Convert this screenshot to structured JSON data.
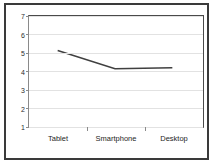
{
  "chart_data": {
    "type": "line",
    "title": "",
    "subtitle": "",
    "xlabel": "",
    "ylabel": "",
    "categories": [
      "Tablet",
      "Smartphone",
      "Desktop"
    ],
    "series": [
      {
        "name": "",
        "values": [
          5.1,
          4.1,
          4.15
        ],
        "color": "#404040"
      }
    ],
    "ylim": [
      1,
      7
    ],
    "yticks": [
      1,
      2,
      3,
      4,
      5,
      6,
      7
    ],
    "ytick_labels": [
      "1",
      "2",
      "3",
      "4",
      "5",
      "6",
      "7"
    ],
    "grid": true,
    "grid_axis": "y",
    "legend": false,
    "legend_position": "none",
    "markers": false,
    "colors": {
      "frame": "#3a3a3a",
      "plot_border": "#4a4a4a",
      "gridline": "#e2e2e2",
      "line": "#404040",
      "text": "#1e1e1e",
      "background": "#ffffff"
    }
  }
}
